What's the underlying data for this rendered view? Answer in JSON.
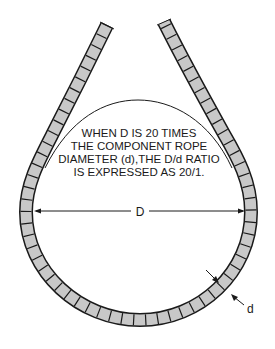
{
  "diagram": {
    "caption": {
      "lines": [
        "WHEN D IS 20 TIMES",
        "THE COMPONENT ROPE",
        "DIAMETER (d),THE D/d RATIO",
        "IS EXPRESSED AS 20/1."
      ]
    },
    "labels": {
      "sheave_diameter": "D",
      "rope_diameter": "d"
    },
    "colors": {
      "rope_fill": "#c8c8c8",
      "outline": "#1a1a1a",
      "background": "#ffffff"
    }
  }
}
